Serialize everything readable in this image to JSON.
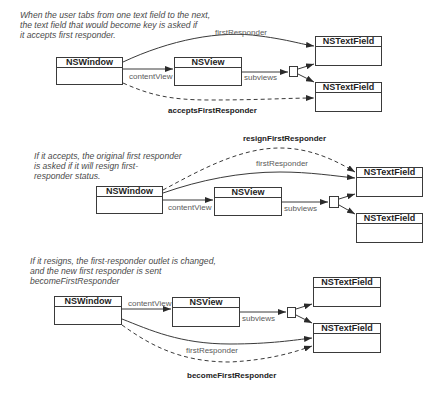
{
  "panels": [
    {
      "caption": [
        "When the user tabs from one text field to the next,",
        "the text field that would become key is asked if",
        "it accepts first responder."
      ],
      "boxes": {
        "window": "NSWindow",
        "view": "NSView",
        "field1": "NSTextField",
        "field2": "NSTextField"
      },
      "labels": {
        "content_view": "contentView",
        "subviews": "subviews",
        "first_responder": "firstResponder",
        "message": "acceptsFirstResponder"
      }
    },
    {
      "caption": [
        "If it accepts,  the original first responder",
        "is asked if it will resign first-",
        "responder status."
      ],
      "boxes": {
        "window": "NSWindow",
        "view": "NSView",
        "field1": "NSTextField",
        "field2": "NSTextField"
      },
      "labels": {
        "content_view": "contentView",
        "subviews": "subviews",
        "first_responder": "firstResponder",
        "message": "resignFirstResponder"
      }
    },
    {
      "caption": [
        "If it resigns, the first-responder outlet is changed,",
        "and the new first responder is sent",
        "becomeFirstResponder"
      ],
      "boxes": {
        "window": "NSWindow",
        "view": "NSView",
        "field1": "NSTextField",
        "field2": "NSTextField"
      },
      "labels": {
        "content_view": "contentView",
        "subviews": "subviews",
        "first_responder": "firstResponder",
        "message": "becomeFirstResponder"
      }
    }
  ],
  "colors": {
    "line": "#3a3a3a",
    "caption": "#4a4a4a",
    "label": "#5a5a5a"
  }
}
